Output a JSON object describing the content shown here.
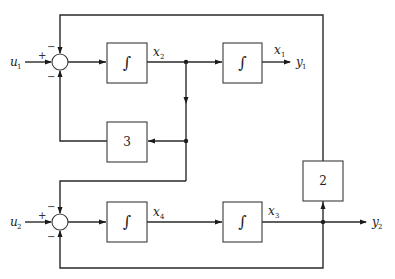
{
  "diagram": {
    "type": "block-diagram",
    "inputs": [
      {
        "name": "u",
        "sub": "1"
      },
      {
        "name": "u",
        "sub": "2"
      }
    ],
    "outputs": [
      {
        "name": "y",
        "sub": "1"
      },
      {
        "name": "y",
        "sub": "2"
      }
    ],
    "summing_junctions": [
      {
        "id": "sum1",
        "signs": {
          "left": "+",
          "top": "−",
          "bottom": "−"
        }
      },
      {
        "id": "sum2",
        "signs": {
          "left": "+",
          "top": "−",
          "bottom": "−"
        }
      }
    ],
    "blocks": [
      {
        "id": "int1",
        "symbol": "∫",
        "output_state": {
          "name": "x",
          "sub": "2"
        }
      },
      {
        "id": "int2",
        "symbol": "∫",
        "output_state": {
          "name": "x",
          "sub": "1"
        }
      },
      {
        "id": "int3",
        "symbol": "∫",
        "output_state": {
          "name": "x",
          "sub": "4"
        }
      },
      {
        "id": "int4",
        "symbol": "∫",
        "output_state": {
          "name": "x",
          "sub": "3"
        }
      },
      {
        "id": "gain3",
        "symbol": "3"
      },
      {
        "id": "gain2",
        "symbol": "2"
      }
    ]
  }
}
